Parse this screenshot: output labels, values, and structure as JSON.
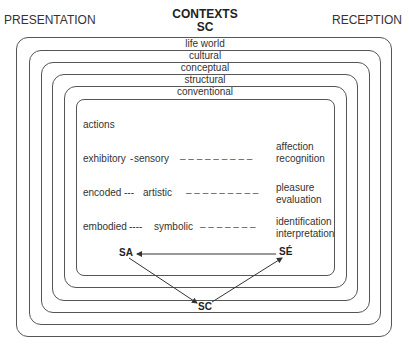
{
  "header": {
    "left_label": "PRESENTATION",
    "title_line1": "CONTEXTS",
    "title_line2": "SC",
    "right_label": "RECEPTION"
  },
  "layers": [
    {
      "label": "life world"
    },
    {
      "label": "cultural"
    },
    {
      "label": "conceptual"
    },
    {
      "label": "structural"
    },
    {
      "label": "conventional"
    }
  ],
  "inner": {
    "heading": "actions",
    "rows": [
      {
        "left": "exhibitory",
        "connector": "-",
        "middle": "sensory",
        "right_line1": "affection",
        "right_line2": "recognition"
      },
      {
        "left": "encoded",
        "connector": "---",
        "middle": "artistic",
        "right_line1": "pleasure",
        "right_line2": "evaluation"
      },
      {
        "left": "embodied",
        "connector": "----",
        "middle": "symbolic",
        "right_line1": "identification",
        "right_line2": "interpretation"
      }
    ],
    "dashes": "– – – – – – – – –"
  },
  "nodes": {
    "sa": "SA",
    "se": "SÉ",
    "sc": "SC"
  }
}
